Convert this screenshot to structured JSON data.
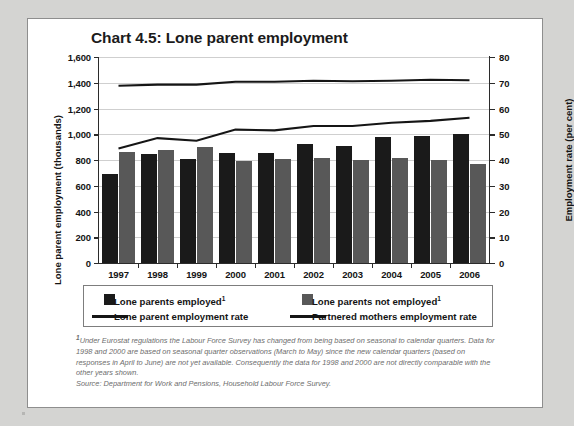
{
  "chart_data": {
    "type": "bar",
    "title": "Chart 4.5: Lone parent employment",
    "xlabel": "",
    "ylabel": "Lone parent employment (thousands)",
    "y2label": "Employment rate (per cent)",
    "categories": [
      "1997",
      "1998",
      "1999",
      "2000",
      "2001",
      "2002",
      "2003",
      "2004",
      "2005",
      "2006"
    ],
    "ylim": [
      0,
      1600
    ],
    "y2lim": [
      0,
      80
    ],
    "yticks": [
      "0",
      "200",
      "400",
      "600",
      "800",
      "1,000",
      "1,200",
      "1,400",
      "1,600"
    ],
    "y2ticks": [
      "0",
      "10",
      "20",
      "30",
      "40",
      "50",
      "60",
      "70",
      "80"
    ],
    "grid": true,
    "legend_position": "bottom",
    "series": [
      {
        "name": "Lone parents employed",
        "footnote_marker": "1",
        "type": "bar",
        "axis": "left",
        "color": "#1a1a1a",
        "values": [
          690,
          845,
          810,
          855,
          855,
          925,
          910,
          975,
          985,
          1000
        ]
      },
      {
        "name": "Lone parents not employed",
        "footnote_marker": "1",
        "type": "bar",
        "axis": "left",
        "color": "#585858",
        "values": [
          860,
          880,
          900,
          795,
          805,
          815,
          800,
          815,
          800,
          770
        ]
      },
      {
        "name": "Lone parent employment rate",
        "type": "line",
        "axis": "right",
        "color": "#151515",
        "values": [
          44.5,
          48.5,
          47.5,
          51.8,
          51.5,
          53.2,
          53.2,
          54.5,
          55.2,
          56.4
        ]
      },
      {
        "name": "Partnered mothers employment rate",
        "type": "line",
        "axis": "right",
        "color": "#151515",
        "values": [
          68.8,
          69.3,
          69.3,
          70.4,
          70.4,
          70.8,
          70.6,
          70.8,
          71.2,
          71.0
        ]
      }
    ]
  },
  "legend": {
    "items": [
      {
        "label": "Lone parents employed",
        "marker": "1",
        "swatch": "box-dark"
      },
      {
        "label": "Lone parents not employed",
        "marker": "1",
        "swatch": "box-grey"
      },
      {
        "label": "Lone parent employment rate",
        "marker": "",
        "swatch": "line"
      },
      {
        "label": "Partnered mothers employment rate",
        "marker": "",
        "swatch": "line"
      }
    ]
  },
  "footnote": {
    "marker": "1",
    "text": "Under Eurostat regulations the Labour Force Survey has changed from being based on seasonal to calendar quarters. Data for 1998 and 2000 are based on seasonal quarter observations (March to May) since the new calendar quarters (based on responses in April to June) are not yet available. Consequently the data for 1998 and 2000 are not directly comparable with the other years shown."
  },
  "source": {
    "text": "Source: Department for Work and Pensions, Household Labour Force Survey."
  },
  "colors": {
    "employed": "#1a1a1a",
    "not_employed": "#585858",
    "line": "#151515",
    "page_background": "#d4d4d2",
    "card_background": "#ffffff"
  }
}
